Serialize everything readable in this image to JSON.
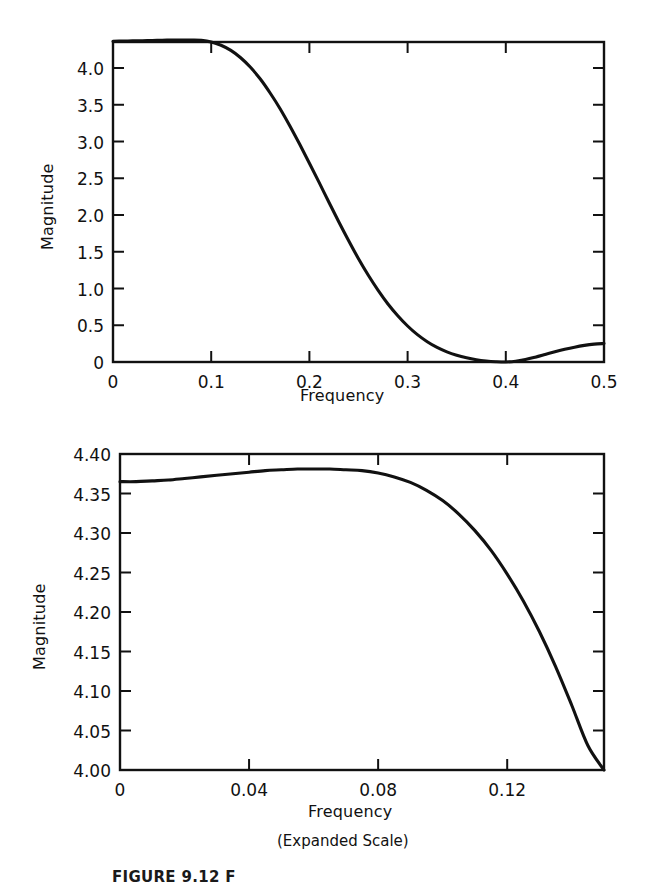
{
  "figure": {
    "caption": "FIGURE 9.12  F",
    "background_color": "#ffffff",
    "line_color": "#111111"
  },
  "panels": {
    "top": {
      "xlabel": "Frequency",
      "ylabel": "Magnitude",
      "x_ticks": [
        "0",
        "0.1",
        "0.2",
        "0.3",
        "0.4",
        "0.5"
      ],
      "y_ticks": [
        "0",
        "0.5",
        "1.0",
        "1.5",
        "2.0",
        "2.5",
        "3.0",
        "3.5",
        "4.0"
      ]
    },
    "bottom": {
      "xlabel": "Frequency",
      "sublabel": "(Expanded Scale)",
      "ylabel": "Magnitude",
      "x_ticks": [
        "0",
        "0.04",
        "0.08",
        "0.12"
      ],
      "y_ticks": [
        "4.00",
        "4.05",
        "4.10",
        "4.15",
        "4.20",
        "4.25",
        "4.30",
        "4.35",
        "4.40"
      ]
    }
  },
  "chart_data": [
    {
      "id": "magnitude-response-full",
      "type": "line",
      "title": "",
      "xlabel": "Frequency",
      "ylabel": "Magnitude",
      "xlim": [
        0,
        0.5
      ],
      "ylim": [
        0,
        4.354
      ],
      "xticks": [
        0,
        0.1,
        0.2,
        0.3,
        0.4,
        0.5
      ],
      "yticks": [
        0,
        0.5,
        1.0,
        1.5,
        2.0,
        2.5,
        3.0,
        3.5,
        4.0
      ],
      "grid": false,
      "legend": null,
      "x": [
        0.0,
        0.01,
        0.02,
        0.03,
        0.04,
        0.05,
        0.06,
        0.07,
        0.08,
        0.09,
        0.1,
        0.11,
        0.12,
        0.13,
        0.14,
        0.15,
        0.16,
        0.17,
        0.18,
        0.19,
        0.2,
        0.21,
        0.22,
        0.23,
        0.24,
        0.25,
        0.26,
        0.27,
        0.28,
        0.29,
        0.3,
        0.31,
        0.32,
        0.33,
        0.34,
        0.35,
        0.36,
        0.37,
        0.38,
        0.39,
        0.4,
        0.41,
        0.42,
        0.43,
        0.44,
        0.45,
        0.46,
        0.47,
        0.48,
        0.49,
        0.5
      ],
      "y": [
        4.365,
        4.366,
        4.369,
        4.372,
        4.375,
        4.378,
        4.38,
        4.381,
        4.38,
        4.376,
        4.355,
        4.31,
        4.24,
        4.14,
        4.01,
        3.85,
        3.66,
        3.45,
        3.215,
        2.965,
        2.705,
        2.44,
        2.17,
        1.905,
        1.65,
        1.405,
        1.18,
        0.975,
        0.79,
        0.63,
        0.49,
        0.372,
        0.276,
        0.198,
        0.138,
        0.092,
        0.057,
        0.031,
        0.014,
        0.004,
        0.0,
        0.01,
        0.034,
        0.066,
        0.102,
        0.138,
        0.172,
        0.202,
        0.226,
        0.243,
        0.252
      ],
      "notes": "Lowpass magnitude response; passband near 4.37, null at f = 0.4, small sidelobe rising to about 0.25 at f = 0.5."
    },
    {
      "id": "magnitude-response-expanded",
      "type": "line",
      "title": "",
      "xlabel": "Frequency",
      "sublabel": "(Expanded Scale)",
      "ylabel": "Magnitude",
      "xlim": [
        0,
        0.15
      ],
      "ylim": [
        4.0,
        4.4
      ],
      "xticks": [
        0,
        0.04,
        0.08,
        0.12
      ],
      "yticks": [
        4.0,
        4.05,
        4.1,
        4.15,
        4.2,
        4.25,
        4.3,
        4.35,
        4.4
      ],
      "grid": false,
      "legend": null,
      "x": [
        0.0,
        0.005,
        0.01,
        0.015,
        0.02,
        0.025,
        0.03,
        0.035,
        0.04,
        0.045,
        0.05,
        0.055,
        0.06,
        0.065,
        0.07,
        0.075,
        0.08,
        0.085,
        0.09,
        0.095,
        0.1,
        0.105,
        0.11,
        0.115,
        0.12,
        0.125,
        0.13,
        0.135,
        0.14,
        0.145,
        0.15
      ],
      "y": [
        4.365,
        4.365,
        4.366,
        4.367,
        4.369,
        4.371,
        4.373,
        4.375,
        4.377,
        4.379,
        4.38,
        4.381,
        4.381,
        4.381,
        4.38,
        4.379,
        4.376,
        4.371,
        4.364,
        4.354,
        4.341,
        4.324,
        4.303,
        4.278,
        4.248,
        4.214,
        4.175,
        4.131,
        4.082,
        4.031,
        4.0
      ],
      "notes": "Passband ripple detail: starts at 4.365, peaks at about 4.381 near f = 0.065, falls to 4.00 at right edge."
    }
  ]
}
